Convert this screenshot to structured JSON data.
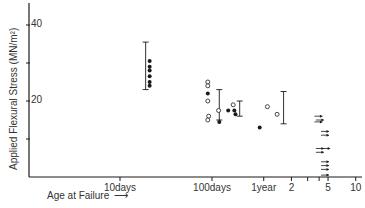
{
  "chart_data": {
    "type": "scatter",
    "title": "",
    "xlabel": "Age at Failure",
    "ylabel": "Applied Flexural Stress (MN/m²)",
    "x_scale": "log",
    "x_unit": "days",
    "x_ticks": [
      {
        "label": "10days",
        "days": 10
      },
      {
        "label": "100days",
        "days": 100
      },
      {
        "label": "1year",
        "days": 365
      },
      {
        "label": "2",
        "days": 730
      },
      {
        "label": "",
        "days": 1095
      },
      {
        "label": "",
        "days": 1460
      },
      {
        "label": "5",
        "days": 1825
      },
      {
        "label": "10",
        "days": 3650
      }
    ],
    "y_ticks": [
      {
        "label": "",
        "value": 10
      },
      {
        "label": "20",
        "value": 20
      },
      {
        "label": "",
        "value": 30
      },
      {
        "label": "40",
        "value": 40
      }
    ],
    "ylim": [
      0,
      46
    ],
    "grid": false,
    "legend": "none",
    "series": [
      {
        "name": "filled",
        "marker": "filled-circle",
        "points": [
          {
            "days": 21,
            "y": 30.5
          },
          {
            "days": 21,
            "y": 29
          },
          {
            "days": 21,
            "y": 28
          },
          {
            "days": 21,
            "y": 26.5
          },
          {
            "days": 21,
            "y": 25
          },
          {
            "days": 21,
            "y": 24
          },
          {
            "days": 90,
            "y": 22
          },
          {
            "days": 120,
            "y": 14.5
          },
          {
            "days": 150,
            "y": 17.5
          },
          {
            "days": 175,
            "y": 17.5
          },
          {
            "days": 180,
            "y": 16.5
          },
          {
            "days": 330,
            "y": 13
          }
        ]
      },
      {
        "name": "open",
        "marker": "open-circle",
        "points": [
          {
            "days": 90,
            "y": 25
          },
          {
            "days": 90,
            "y": 24
          },
          {
            "days": 90,
            "y": 20
          },
          {
            "days": 92,
            "y": 16
          },
          {
            "days": 90,
            "y": 15
          },
          {
            "days": 118,
            "y": 17.5
          },
          {
            "days": 170,
            "y": 19
          },
          {
            "days": 400,
            "y": 18.5
          },
          {
            "days": 510,
            "y": 16.5
          }
        ]
      },
      {
        "name": "unbroken (run-out, arrows)",
        "marker": "arrow-right",
        "points": [
          {
            "days": 1400,
            "y": 16
          },
          {
            "days": 1400,
            "y": 14.5
          },
          {
            "days": 1450,
            "y": 15
          },
          {
            "days": 1650,
            "y": 12
          },
          {
            "days": 1650,
            "y": 11
          },
          {
            "days": 1450,
            "y": 7.5
          },
          {
            "days": 1450,
            "y": 6.5
          },
          {
            "days": 1700,
            "y": 7.5
          },
          {
            "days": 1650,
            "y": 4
          },
          {
            "days": 1650,
            "y": 3
          },
          {
            "days": 1650,
            "y": 2
          },
          {
            "days": 1650,
            "y": 0.5
          }
        ]
      }
    ],
    "error_bars": [
      {
        "days": 19,
        "low": 23,
        "high": 35.5
      },
      {
        "days": 120,
        "low": 15,
        "high": 23
      },
      {
        "days": 200,
        "low": 16,
        "high": 20
      },
      {
        "days": 600,
        "low": 14,
        "high": 22.5
      }
    ]
  },
  "labels": {
    "ylabel": "Applied Flexural Stress (MN/m²)",
    "xlabel": "Age at Failure",
    "caption": "Fig. 4  Stress v. age at failure"
  }
}
